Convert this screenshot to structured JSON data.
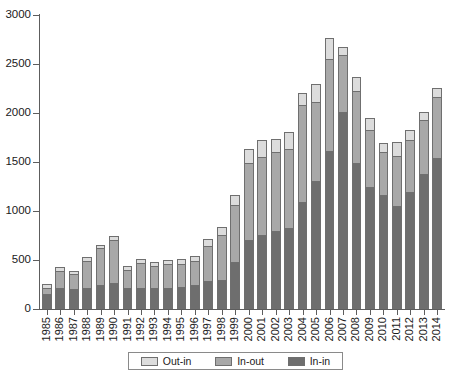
{
  "chart_data": {
    "type": "bar",
    "stacked": true,
    "title": "",
    "subtitle": "",
    "xlabel": "",
    "ylabel": "",
    "ylim": [
      0,
      3000
    ],
    "yticks": [
      0,
      500,
      1000,
      1500,
      2000,
      2500,
      3000
    ],
    "ytick_labels": [
      "0",
      "500",
      "1000",
      "1500",
      "2000",
      "2500",
      "3000"
    ],
    "grid": false,
    "legend_position": "bottom",
    "categories": [
      "1985",
      "1986",
      "1987",
      "1988",
      "1989",
      "1990",
      "1991",
      "1992",
      "1993",
      "1994",
      "1995",
      "1996",
      "1997",
      "1998",
      "1999",
      "2000",
      "2001",
      "2002",
      "2003",
      "2004",
      "2005",
      "2006",
      "2007",
      "2008",
      "2009",
      "2010",
      "2011",
      "2012",
      "2013",
      "2014"
    ],
    "series": [
      {
        "name": "In-in",
        "color": "#6e6e6e",
        "values": [
          155,
          215,
          205,
          210,
          250,
          270,
          210,
          215,
          210,
          215,
          225,
          245,
          285,
          300,
          480,
          700,
          760,
          800,
          830,
          1090,
          1310,
          1610,
          2010,
          1490,
          1240,
          1165,
          1050,
          1195,
          1375,
          1545
        ]
      },
      {
        "name": "In-out",
        "color": "#a8a8a8",
        "values": [
          60,
          175,
          155,
          280,
          370,
          430,
          190,
          250,
          225,
          245,
          230,
          245,
          355,
          455,
          585,
          790,
          790,
          805,
          800,
          990,
          800,
          940,
          580,
          730,
          590,
          440,
          510,
          530,
          555,
          620
        ]
      },
      {
        "name": "Out-in",
        "color": "#dcdcdc",
        "values": [
          45,
          35,
          30,
          40,
          30,
          50,
          40,
          45,
          40,
          45,
          55,
          55,
          70,
          80,
          100,
          145,
          170,
          135,
          175,
          125,
          190,
          215,
          85,
          150,
          120,
          85,
          140,
          105,
          80,
          95
        ]
      }
    ],
    "totals": [
      260,
      425,
      390,
      530,
      650,
      750,
      440,
      510,
      475,
      505,
      510,
      545,
      710,
      835,
      1165,
      1635,
      1720,
      1740,
      1805,
      2205,
      2300,
      2765,
      2675,
      2370,
      1950,
      1690,
      1700,
      1830,
      2010,
      2260
    ]
  },
  "legend": {
    "items": [
      {
        "label": "Out-in",
        "key": "s2"
      },
      {
        "label": "In-out",
        "key": "s1"
      },
      {
        "label": "In-in",
        "key": "s0"
      }
    ]
  }
}
